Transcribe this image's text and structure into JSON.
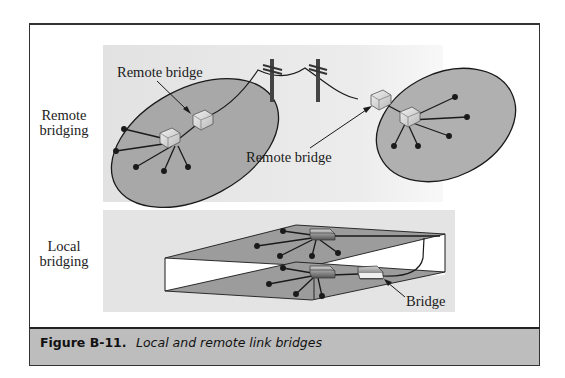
{
  "figure": {
    "number": "Figure B-11.",
    "caption": "Local and remote link bridges"
  },
  "panels": {
    "remote": {
      "side_label_line1": "Remote",
      "side_label_line2": "bridging",
      "callout_left": "Remote bridge",
      "callout_right": "Remote bridge"
    },
    "local": {
      "side_label_line1": "Local",
      "side_label_line2": "bridging",
      "callout": "Bridge"
    }
  },
  "colors": {
    "panel_bg": "#e4e4e4",
    "lan_fill": "#a9a9a9",
    "plane_fill": "#9a9a9a",
    "caption_bar": "#bdbdbd",
    "line": "#1a1a1a"
  }
}
